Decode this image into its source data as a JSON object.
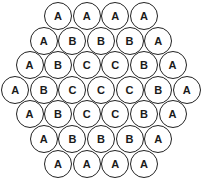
{
  "diagram": {
    "rows": [
      [
        "A",
        "A",
        "A",
        "A"
      ],
      [
        "A",
        "B",
        "B",
        "B",
        "A"
      ],
      [
        "A",
        "B",
        "C",
        "C",
        "B",
        "A"
      ],
      [
        "A",
        "B",
        "C",
        "C",
        "C",
        "B",
        "A"
      ],
      [
        "A",
        "B",
        "C",
        "C",
        "B",
        "A"
      ],
      [
        "A",
        "B",
        "B",
        "B",
        "A"
      ],
      [
        "A",
        "A",
        "A",
        "A"
      ]
    ],
    "colors": {
      "stroke": "#222222",
      "fill": "#ffffff",
      "text": "#1a1a1a"
    }
  }
}
